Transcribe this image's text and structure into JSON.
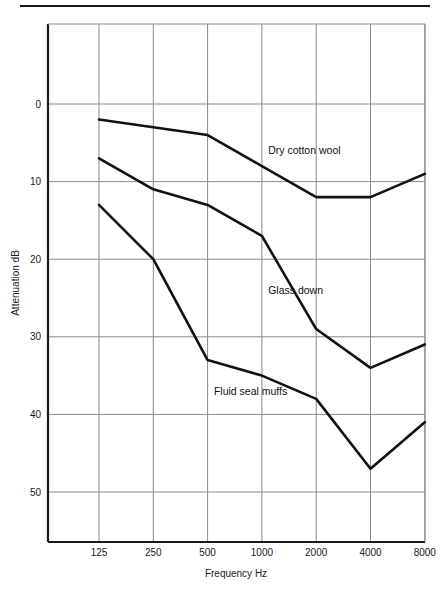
{
  "figure": {
    "has_top_rule": true,
    "background_color": "#ffffff",
    "line_color": "#111111",
    "grid_color": "#8a8a8a",
    "axis_color": "#1a1a1a"
  },
  "chart_data": {
    "type": "line",
    "title": "",
    "xlabel": "Frequency Hz",
    "ylabel": "Attenuation dB",
    "x_tick_labels": [
      "125",
      "250",
      "500",
      "1000",
      "2000",
      "4000",
      "8000"
    ],
    "x": [
      125,
      250,
      500,
      1000,
      2000,
      4000,
      8000
    ],
    "x_scale": "log-category",
    "y_tick_labels": [
      "0",
      "10",
      "20",
      "30",
      "40",
      "50"
    ],
    "y_ticks": [
      0,
      10,
      20,
      30,
      40,
      50
    ],
    "ylim": [
      -8,
      56
    ],
    "y_inverted": true,
    "grid": true,
    "legend": "inline-annotations",
    "series": [
      {
        "name": "Dry cotton wool",
        "values": [
          2,
          3,
          4,
          8,
          12,
          12,
          9
        ],
        "label_x": 2000,
        "label_y": 6.5
      },
      {
        "name": "Glass down",
        "values": [
          7,
          11,
          13,
          17,
          29,
          34,
          31
        ],
        "label_x": 2000,
        "label_y": 24.5
      },
      {
        "name": "Fluid seal muffs",
        "values": [
          13,
          20,
          33,
          35,
          38,
          47,
          41
        ],
        "label_x": 1000,
        "label_y": 37.5
      }
    ]
  }
}
